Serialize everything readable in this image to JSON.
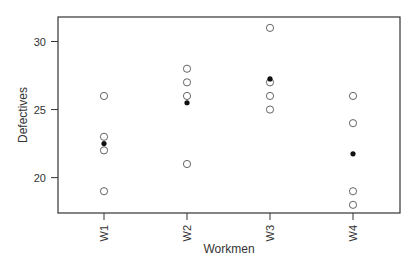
{
  "chart_data": {
    "type": "scatter",
    "title": "",
    "xlabel": "Workmen",
    "ylabel": "Defectives",
    "categories": [
      "W1",
      "W2",
      "W3",
      "W4"
    ],
    "ylim": [
      17.4,
      31.8
    ],
    "yticks": [
      20,
      25,
      30
    ],
    "grid": false,
    "legend": "none",
    "series": [
      {
        "name": "observations",
        "marker": "open-circle",
        "points": [
          {
            "category": "W1",
            "values": [
              26,
              23,
              22,
              19
            ]
          },
          {
            "category": "W2",
            "values": [
              28,
              27,
              26,
              21
            ]
          },
          {
            "category": "W3",
            "values": [
              31,
              27,
              26,
              25
            ]
          },
          {
            "category": "W4",
            "values": [
              26,
              24,
              19,
              18
            ]
          }
        ]
      },
      {
        "name": "mean",
        "marker": "filled-circle",
        "points": [
          {
            "category": "W1",
            "value": 22.5
          },
          {
            "category": "W2",
            "value": 25.5
          },
          {
            "category": "W3",
            "value": 27.25
          },
          {
            "category": "W4",
            "value": 21.75
          }
        ]
      }
    ]
  },
  "colors": {
    "axis": "#333333",
    "marker_open": "#555555",
    "marker_filled": "#111111"
  }
}
